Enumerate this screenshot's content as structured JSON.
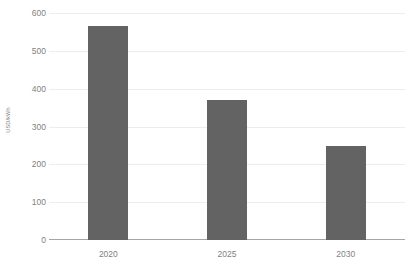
{
  "chart_data": {
    "type": "bar",
    "title": "",
    "subtitle": "",
    "categories": [
      "2020",
      "2025",
      "2030"
    ],
    "values": [
      565,
      370,
      248
    ],
    "series": [
      {
        "name": "USD/kWh",
        "values": [
          565,
          370,
          248
        ]
      }
    ],
    "xlabel": "",
    "ylabel": "USD/kWh",
    "ylim": [
      0,
      600
    ],
    "yticks": [
      0,
      100,
      200,
      300,
      400,
      500,
      600
    ],
    "ytick_labels": [
      "0",
      "100",
      "200",
      "300",
      "400",
      "500",
      "600"
    ],
    "grid": true,
    "grid_axis": "y",
    "legend": false,
    "legend_position": "none",
    "annotations": [],
    "bar_color": "#636363",
    "gridline_color": "#ededed",
    "axis_line_color": "#a6a6a6",
    "tick_label_color": "#7f7f7f",
    "background_color": "#ffffff"
  }
}
